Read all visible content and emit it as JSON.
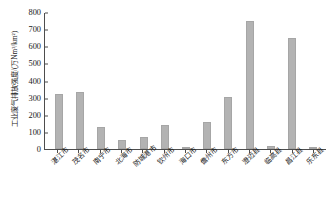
{
  "chart_data": {
    "type": "bar",
    "title": "",
    "xlabel": "",
    "ylabel": "工业废气排放强度/(万Nm³/km²)",
    "ylim": [
      0,
      800
    ],
    "yticks": [
      800,
      700,
      600,
      500,
      400,
      300,
      200,
      100,
      0
    ],
    "grid": false,
    "legend": "none",
    "bar_color": "#b3b3b3",
    "axis_color": "#4d4d4d",
    "categories": [
      "湛江市",
      "茂名市",
      "南宁市",
      "北海市",
      "防城港市",
      "钦州市",
      "海口市",
      "儋州市",
      "东方市",
      "澄迈县",
      "临高县",
      "昌江县",
      "乐东县"
    ],
    "values": [
      320,
      335,
      128,
      55,
      72,
      140,
      12,
      155,
      305,
      745,
      18,
      650,
      6
    ],
    "series": [
      {
        "name": "工业废气排放强度",
        "values": [
          320,
          335,
          128,
          55,
          72,
          140,
          12,
          155,
          305,
          745,
          18,
          650,
          6
        ]
      }
    ]
  }
}
